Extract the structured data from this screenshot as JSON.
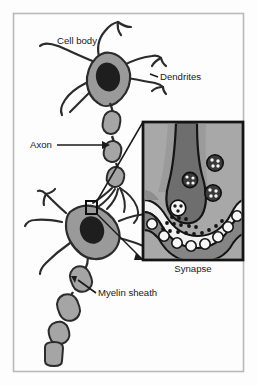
{
  "figure": {
    "frame_color": "#b9b9b9",
    "background_color": "#fdfdfd"
  },
  "palette": {
    "cell_fill": "#9a9a9a",
    "cell_outline": "#2b2b2b",
    "nucleus_fill": "#1e1e1e",
    "myelin_fill": "#a5a5a5",
    "inset_background": "#a8a8a8",
    "inset_terminal": "#6e6e6e",
    "inset_cleft": "#f2f2f2",
    "inset_border": "#141414",
    "label_color": "#1a1a1a",
    "vesicle_dark": "#3a3a3a",
    "vesicle_light": "#f5f5f5"
  },
  "labels": [
    {
      "id": "cell-body",
      "text": "Cell body",
      "x": 57,
      "y": 44,
      "anchor": "start",
      "has_leader": false
    },
    {
      "id": "dendrites",
      "text": "Dendrites",
      "x": 160,
      "y": 80,
      "anchor": "start",
      "has_leader": true
    },
    {
      "id": "axon",
      "text": "Axon",
      "x": 30,
      "y": 148,
      "anchor": "start",
      "has_leader": true
    },
    {
      "id": "myelin-sheath",
      "text": "Myelin sheath",
      "x": 98,
      "y": 293,
      "anchor": "start",
      "has_leader": true
    },
    {
      "id": "synapse",
      "text": "Synapse",
      "x": 193,
      "y": 272,
      "anchor": "middle",
      "has_leader": false
    }
  ],
  "inset": {
    "name": "synapse-detail-inset",
    "x": 143,
    "y": 122,
    "width": 100,
    "height": 138,
    "caption": "Synapse"
  },
  "callout": {
    "source_box": {
      "x": 86,
      "y": 201,
      "width": 11,
      "height": 13
    },
    "description": "magnification lines from axon terminal to synapse inset"
  },
  "structures": [
    {
      "id": "upper-neuron-soma",
      "label": "Cell body"
    },
    {
      "id": "upper-neuron-dendrites",
      "label": "Dendrites"
    },
    {
      "id": "upper-neuron-axon",
      "label": "Axon"
    },
    {
      "id": "lower-neuron-soma",
      "label": "Cell body"
    },
    {
      "id": "lower-neuron-myelin",
      "label": "Myelin sheath"
    },
    {
      "id": "synapse-terminal",
      "label": "Synapse"
    }
  ],
  "synapse_parts": {
    "vesicles_dark_count": 3,
    "vesicles_releasing_count": 1,
    "neurotransmitter_dots_count": 17,
    "receptor_circles_count": 8
  }
}
